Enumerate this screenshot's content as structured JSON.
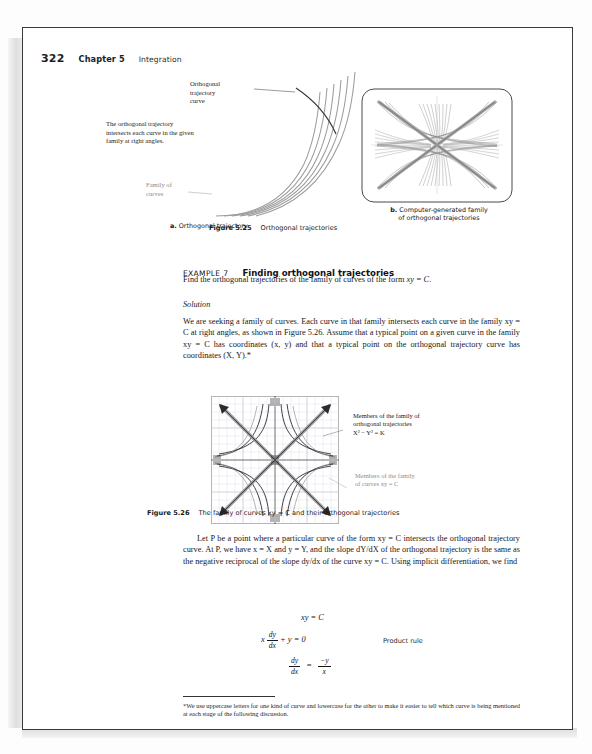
{
  "page": {
    "folio": "322",
    "chapter": "Chapter 5",
    "section": "Integration"
  },
  "figure_525": {
    "panel_a": {
      "label_curve": "Orthogonal\ntrajectory\ncurve",
      "label_note": "The orthogonal trajectory\nintersects each curve in the given\nfamily at right angles.",
      "label_family": "Family of\ncurves",
      "caption_letter": "a.",
      "caption_text": "Orthogonal trajectory"
    },
    "panel_b": {
      "caption_letter": "b.",
      "caption_text": "Computer-generated family\nof orthogonal trajectories"
    },
    "caption_number": "Figure 5.25",
    "caption_text": "Orthogonal trajectories"
  },
  "example": {
    "label": "EXAMPLE 7",
    "title": "Finding orthogonal trajectories",
    "statement_pre": "Find the orthogonal trajectories of the family of curves of the form ",
    "statement_math": "xy = C",
    "statement_post": ".",
    "solution_heading": "Solution",
    "solution_paragraph": "We are seeking a family of curves. Each curve in that family intersects each curve in the family xy = C at right angles, as shown in Figure 5.26.  Assume that a typical point on a given curve in the family xy = C has coordinates (x, y) and that a typical point on the orthogonal trajectory curve has coordinates (X, Y).*"
  },
  "figure_526": {
    "annotation_orthogonal": "Members of the family of\northogonal trajectories\nX² − Y² = K",
    "annotation_curves": "Members of the family\nof curves xy = C",
    "caption_number": "Figure 5.26",
    "caption_text": "The family of curves xy = C and their orthogonal trajectories"
  },
  "derivation": {
    "paragraph": "Let P be a point where a particular curve of the form xy = C intersects the orthogonal trajectory curve. At P, we have x = X and y = Y, and the slope dY/dX of the orthogonal trajectory is the same as the negative reciprocal of the slope dy/dx of the curve xy = C. Using implicit differentiation, we find",
    "equations": [
      {
        "lhs": "xy = C",
        "note": ""
      },
      {
        "lhs": "x dy/dx + y = 0",
        "note": "Product rule"
      },
      {
        "lhs": "dy/dx = −y/x",
        "note": ""
      }
    ],
    "eq1_text": "xy = C",
    "eq2_x": "x",
    "eq2_num": "dy",
    "eq2_den": "dx",
    "eq2_tail": "+ y = 0",
    "eq2_note": "Product rule",
    "eq3_num": "dy",
    "eq3_den": "dx",
    "eq3_eq": "=",
    "eq3_rnum": "−y",
    "eq3_rden": "x"
  },
  "footnote": {
    "text": "*We use uppercase letters for one kind of curve and lowercase for the other to make it easier to tell which curve is being mentioned at each stage of the following discussion."
  },
  "colors": {
    "ink": "#17171a",
    "gray_label": "#8d8d8d",
    "curve_gray": "#9a9a9a",
    "curve_dark": "#2f2f33",
    "grid": "#c9c9d6"
  }
}
